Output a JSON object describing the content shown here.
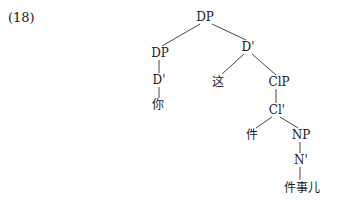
{
  "example_number": "(18)",
  "tree": {
    "nodes": {
      "dp_root": "DP",
      "dp_left": "DP",
      "dbar_right": "D'",
      "dbar_left": "D'",
      "zhe": "这",
      "clp": "ClP",
      "ni": "你",
      "clbar": "Cl'",
      "jian": "件",
      "np": "NP",
      "nbar": "N'",
      "jianshier": "件事儿"
    }
  }
}
